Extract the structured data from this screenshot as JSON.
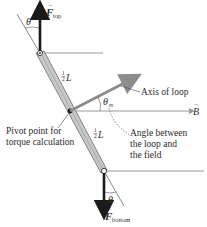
{
  "diagram": {
    "labels": {
      "f_top": "F",
      "f_top_sub": "top",
      "f_bottom": "F",
      "f_bottom_sub": "bottom",
      "theta": "θ",
      "theta_m": "θ",
      "theta_m_sub": "m",
      "half_l_top": "L",
      "half_l_bottom": "L",
      "half": "1/2",
      "axis": "Axis of loop",
      "b_field": "B",
      "pivot_line1": "Pivot point for",
      "pivot_line2": "torque calculation",
      "angle_line1": "Angle between",
      "angle_line2": "the loop and",
      "angle_line3": "the field"
    },
    "colors": {
      "force_arrow": "#1a1a1a",
      "field_line": "#9a9a9a",
      "axis_arrow": "#8c8c8c",
      "rod_fill": "#c8c8c8",
      "rod_edge": "#6a6a6a",
      "text": "#2b2b2b"
    }
  }
}
